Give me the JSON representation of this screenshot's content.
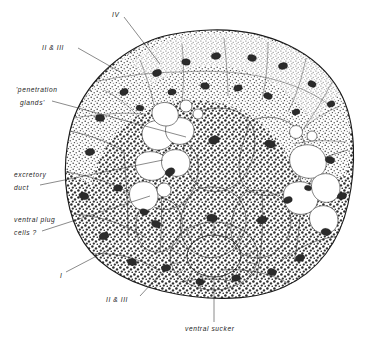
{
  "figure": {
    "background_color": "#ffffff",
    "ink_color": "#1b1b1b",
    "width": 386,
    "height": 345
  },
  "labels": [
    {
      "id": "iv",
      "text": "IV",
      "style": "italic",
      "x": 112,
      "y": 14,
      "anchor": "start",
      "leader": [
        [
          124,
          17
        ],
        [
          160,
          64
        ]
      ]
    },
    {
      "id": "ii-iii-top",
      "text": "II & III",
      "style": "italic",
      "x": 42,
      "y": 46,
      "anchor": "start",
      "leader": [
        [
          78,
          48
        ],
        [
          122,
          73
        ]
      ]
    },
    {
      "id": "penetration-glands-line1",
      "text": "'penetration",
      "style": "italic",
      "x": 16,
      "y": 90,
      "anchor": "start",
      "leader": null
    },
    {
      "id": "penetration-glands-line2",
      "text": "glands'",
      "style": "italic",
      "x": 20,
      "y": 103,
      "anchor": "start",
      "leader": [
        [
          52,
          101
        ],
        [
          186,
          137
        ]
      ]
    },
    {
      "id": "excretory-duct-line1",
      "text": "excretory",
      "style": "italic",
      "x": 14,
      "y": 175,
      "anchor": "start",
      "leader": null
    },
    {
      "id": "excretory-duct-line2",
      "text": "duct",
      "style": "italic",
      "x": 14,
      "y": 188,
      "anchor": "start",
      "leader": [
        [
          40,
          185
        ],
        [
          163,
          160
        ]
      ]
    },
    {
      "id": "ventral-plug-cells-line1",
      "text": "ventral  plug",
      "style": "italic",
      "x": 14,
      "y": 220,
      "anchor": "start",
      "leader": null
    },
    {
      "id": "ventral-plug-cells-line2",
      "text": "cells ?",
      "style": "italic",
      "x": 14,
      "y": 233,
      "anchor": "start",
      "leader": [
        [
          42,
          231
        ],
        [
          150,
          196
        ]
      ]
    },
    {
      "id": "i",
      "text": "I",
      "style": "italic",
      "x": 60,
      "y": 276,
      "anchor": "start",
      "leader": [
        [
          66,
          272
        ],
        [
          112,
          248
        ]
      ]
    },
    {
      "id": "ii-iii-bottom",
      "text": "II & III",
      "style": "italic",
      "x": 106,
      "y": 300,
      "anchor": "start",
      "leader": [
        [
          140,
          296
        ],
        [
          164,
          270
        ]
      ]
    },
    {
      "id": "ventral-sucker",
      "text": "ventral  sucker",
      "style": "italic",
      "x": 185,
      "y": 329,
      "anchor": "start",
      "leader": [
        [
          214,
          322
        ],
        [
          214,
          288
        ]
      ]
    }
  ],
  "regions": [
    {
      "id": "layer-I",
      "name": "cell layer I",
      "description": "outer coarse dark-stippled cells"
    },
    {
      "id": "layer-II-III",
      "name": "cell layers II & III",
      "description": "medium stippled cells"
    },
    {
      "id": "layer-IV",
      "name": "cell layer IV",
      "description": "dorsal fine stippled cells"
    },
    {
      "id": "penetration-glands",
      "name": "penetration glands",
      "description": "large pale stippled gland cells, central"
    },
    {
      "id": "excretory-duct",
      "name": "excretory duct",
      "description": "cluster of clear vacuolate cells"
    },
    {
      "id": "ventral-plug-cells",
      "name": "ventral plug cells",
      "description": "clear cells ventro-laterally"
    },
    {
      "id": "ventral-sucker",
      "name": "ventral sucker",
      "description": "radially striated ring with oval lumen"
    }
  ]
}
